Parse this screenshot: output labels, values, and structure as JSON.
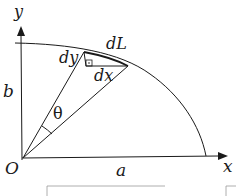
{
  "diagram": {
    "type": "ellipse-quadrant-arc-length",
    "axes": {
      "x_label": "x",
      "y_label": "y",
      "origin_label": "O"
    },
    "semi_axes": {
      "horizontal_label": "a",
      "vertical_label": "b"
    },
    "element_labels": {
      "arc_element": "dL",
      "horizontal_leg": "dx",
      "vertical_leg": "dy",
      "angle": "θ"
    },
    "right_angle_marker": "square-with-dot",
    "colors": {
      "stroke": "#1a1a1a",
      "background": "#ffffff",
      "bottom_box_stroke": "#9a9a9a"
    }
  }
}
